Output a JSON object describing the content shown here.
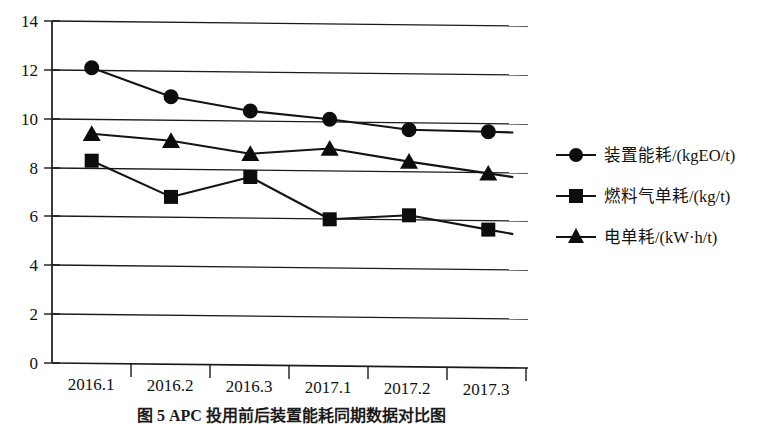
{
  "chart_data": {
    "type": "line",
    "title": "",
    "xlabel": "",
    "ylabel": "",
    "ylim": [
      0,
      14
    ],
    "ytick_interval": 2,
    "grid": true,
    "grid_axis": "y",
    "legend_position": "right",
    "categories": [
      "2016.1",
      "2016.2",
      "2016.3",
      "2017.1",
      "2017.2",
      "2017.3"
    ],
    "yticks": [
      "0",
      "2",
      "4",
      "6",
      "8",
      "10",
      "12",
      "14"
    ],
    "series": [
      {
        "name": "装置能耗/(kgEO/t)",
        "marker": "circle",
        "color": "#0d0d0d",
        "values": [
          12.1,
          10.95,
          10.4,
          10.1,
          9.7,
          9.65
        ]
      },
      {
        "name": "燃料气单耗/(kg/t)",
        "marker": "square",
        "color": "#0d0d0d",
        "values": [
          8.3,
          6.85,
          7.7,
          6.0,
          6.2,
          5.65
        ]
      },
      {
        "name": "电单耗/(kW·h/t)",
        "marker": "triangle",
        "color": "#0d0d0d",
        "values": [
          9.4,
          9.15,
          8.65,
          8.9,
          8.4,
          7.95
        ]
      }
    ]
  },
  "caption": {
    "text": "图 5   APC 投用前后装置能耗同期数据对比图"
  }
}
